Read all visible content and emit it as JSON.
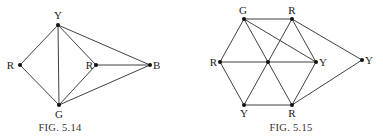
{
  "figures": [
    {
      "caption": "Fig. 5.14",
      "caption_display": "FIG. 5.14",
      "caption_pos": [
        60,
        131
      ],
      "nodes": [
        {
          "id": "Y",
          "label": "Y",
          "x": 58,
          "y": 25,
          "lx": 58,
          "ly": 19,
          "anchor": "middle"
        },
        {
          "id": "R1",
          "label": "R",
          "x": 20,
          "y": 65,
          "lx": 14,
          "ly": 69,
          "anchor": "end"
        },
        {
          "id": "R2",
          "label": "R",
          "x": 96,
          "y": 65,
          "lx": 93,
          "ly": 69,
          "anchor": "end"
        },
        {
          "id": "B",
          "label": "B",
          "x": 150,
          "y": 65,
          "lx": 153,
          "ly": 69,
          "anchor": "start"
        },
        {
          "id": "G",
          "label": "G",
          "x": 59,
          "y": 105,
          "lx": 59,
          "ly": 118,
          "anchor": "middle"
        }
      ],
      "edges": [
        [
          "Y",
          "R1"
        ],
        [
          "Y",
          "G"
        ],
        [
          "Y",
          "R2"
        ],
        [
          "Y",
          "B"
        ],
        [
          "R1",
          "G"
        ],
        [
          "R2",
          "G"
        ],
        [
          "R2",
          "B"
        ],
        [
          "G",
          "B"
        ]
      ]
    },
    {
      "caption": "Fig. 5.15",
      "caption_display": "FIG. 5.15",
      "caption_pos": [
        291,
        131
      ],
      "nodes": [
        {
          "id": "G",
          "label": "G",
          "x": 244,
          "y": 19,
          "lx": 243,
          "ly": 14,
          "anchor": "middle"
        },
        {
          "id": "R1",
          "label": "R",
          "x": 292,
          "y": 19,
          "lx": 292,
          "ly": 14,
          "anchor": "middle"
        },
        {
          "id": "R2",
          "label": "R",
          "x": 220,
          "y": 62,
          "lx": 217,
          "ly": 66,
          "anchor": "end"
        },
        {
          "id": "C",
          "label": "",
          "x": 268,
          "y": 62,
          "lx": 268,
          "ly": 62,
          "anchor": "middle"
        },
        {
          "id": "Y1",
          "label": "Y",
          "x": 316,
          "y": 62,
          "lx": 319,
          "ly": 66,
          "anchor": "start"
        },
        {
          "id": "Y2",
          "label": "Y",
          "x": 362,
          "y": 60,
          "lx": 365,
          "ly": 64,
          "anchor": "start"
        },
        {
          "id": "Y3",
          "label": "Y",
          "x": 244,
          "y": 105,
          "lx": 244,
          "ly": 117,
          "anchor": "middle"
        },
        {
          "id": "R3",
          "label": "R",
          "x": 292,
          "y": 105,
          "lx": 292,
          "ly": 117,
          "anchor": "middle"
        }
      ],
      "edges": [
        [
          "G",
          "R1"
        ],
        [
          "G",
          "R2"
        ],
        [
          "G",
          "C"
        ],
        [
          "G",
          "Y1"
        ],
        [
          "R1",
          "C"
        ],
        [
          "R1",
          "Y1"
        ],
        [
          "R1",
          "Y2"
        ],
        [
          "R2",
          "C"
        ],
        [
          "R2",
          "Y3"
        ],
        [
          "C",
          "Y1"
        ],
        [
          "C",
          "Y3"
        ],
        [
          "C",
          "R3"
        ],
        [
          "Y1",
          "R3"
        ],
        [
          "Y3",
          "R3"
        ],
        [
          "R3",
          "Y2"
        ]
      ]
    }
  ]
}
